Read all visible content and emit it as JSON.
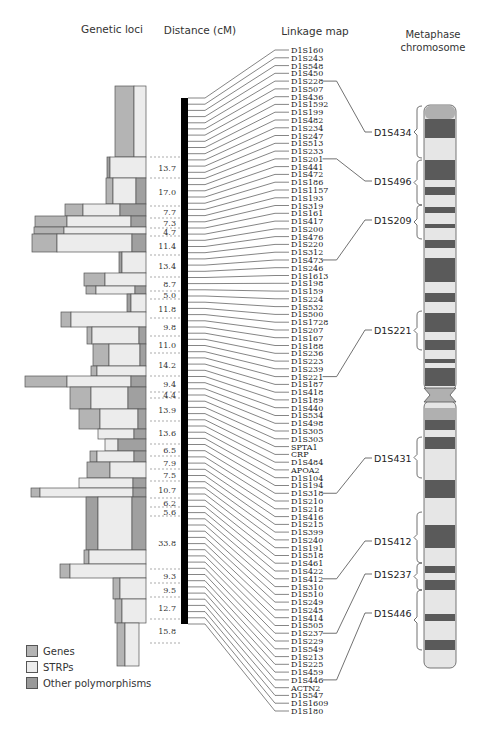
{
  "headers": {
    "genetic_loci": "Genetic loci",
    "distance": "Distance (cM)",
    "linkage_map": "Linkage map",
    "metaphase": "Metaphase chromosome"
  },
  "legend": [
    {
      "label": "Genes",
      "color": "#b4b4b4"
    },
    {
      "label": "STRPs",
      "color": "#ececec"
    },
    {
      "label": "Other polymorphisms",
      "color": "#9a9a9a"
    }
  ],
  "colors": {
    "gene": "#b4b4b4",
    "strp": "#ececec",
    "other": "#a0a0a0",
    "band_dark": "#5a5a5a",
    "band_light": "#e6e6e6",
    "centromere": "#b0b0b0",
    "map_bar": "#000000"
  },
  "distances": [
    "13.7",
    "17.0",
    "7.7",
    "7.3",
    "4.7",
    "11.4",
    "13.4",
    "8.7",
    "5.0",
    "11.8",
    "9.8",
    "11.0",
    "14.2",
    "9.4",
    "4.4",
    "13.9",
    "13.6",
    "6.5",
    "7.9",
    "7.5",
    "10.7",
    "6.2",
    "5.6",
    "33.8",
    "9.3",
    "9.5",
    "12.7",
    "15.8"
  ],
  "markers": [
    "D1S160",
    "D1S243",
    "D1S548",
    "D1S450",
    "D1S228",
    "D1S507",
    "D1S436",
    "D1S1592",
    "D1S199",
    "D1S482",
    "D1S234",
    "D1S247",
    "D1S513",
    "D1S233",
    "D1S201",
    "D1S441",
    "D1S472",
    "D1S186",
    "D1S1157",
    "D1S193",
    "D1S319",
    "D1S161",
    "D1S417",
    "D1S200",
    "D1S476",
    "D1S220",
    "D1S312",
    "D1S473",
    "D1S246",
    "D1S1613",
    "D1S198",
    "D1S159",
    "D1S224",
    "D1S532",
    "D1S500",
    "D1S1728",
    "D1S207",
    "D1S167",
    "D1S188",
    "D1S236",
    "D1S223",
    "D1S239",
    "D1S221",
    "D1S187",
    "D1S418",
    "D1S189",
    "D1S440",
    "D1S534",
    "D1S498",
    "D1S305",
    "D1S303",
    "SPTA1",
    "CRP",
    "D1S484",
    "APOA2",
    "D1S104",
    "D1S194",
    "D1S318",
    "D1S210",
    "D1S218",
    "D1S416",
    "D1S215",
    "D1S399",
    "D1S240",
    "D1S191",
    "D1S518",
    "D1S461",
    "D1S422",
    "D1S412",
    "D1S310",
    "D1S510",
    "D1S249",
    "D1S245",
    "D1S414",
    "D1S505",
    "D1S237",
    "D1S229",
    "D1S549",
    "D1S213",
    "D1S225",
    "D1S459",
    "D1S446",
    "ACTN2",
    "D1S547",
    "D1S1609",
    "D1S180"
  ],
  "chromosome_markers": [
    {
      "label": "D1S434",
      "from_marker": "D1S228"
    },
    {
      "label": "D1S496",
      "from_marker": "D1S201"
    },
    {
      "label": "D1S209",
      "from_marker": "D1S473"
    },
    {
      "label": "D1S221",
      "from_marker": "D1S221"
    },
    {
      "label": "D1S431",
      "from_marker": "D1S318"
    },
    {
      "label": "D1S412",
      "from_marker": "D1S412"
    },
    {
      "label": "D1S237",
      "from_marker": "D1S237"
    },
    {
      "label": "D1S446",
      "from_marker": "D1S446"
    }
  ]
}
